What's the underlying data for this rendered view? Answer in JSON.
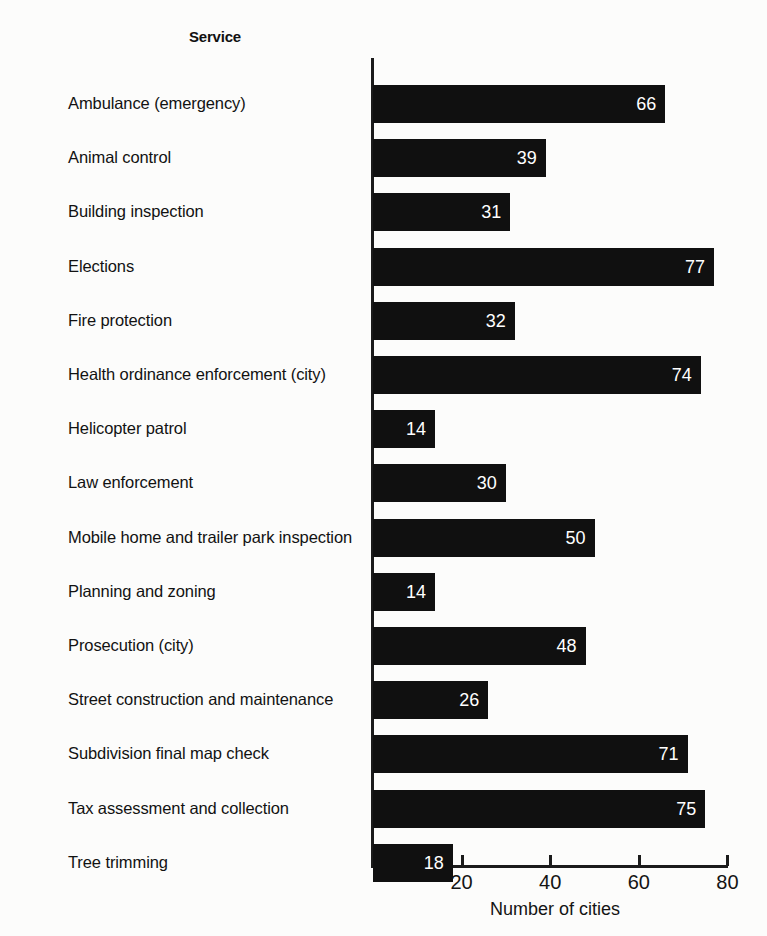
{
  "header": {
    "category_column_title": "Service"
  },
  "chart_data": {
    "type": "bar",
    "orientation": "horizontal",
    "title": "",
    "xlabel": "Number of cities",
    "ylabel": "Service",
    "xlim": [
      0,
      80
    ],
    "xticks": [
      20,
      40,
      60,
      80
    ],
    "grid": false,
    "legend": null,
    "bar_color": "#101010",
    "value_label_color": "#ffffff",
    "background_color": "#fcfcfb",
    "categories": [
      "Ambulance (emergency)",
      "Animal control",
      "Building inspection",
      "Elections",
      "Fire protection",
      "Health ordinance enforcement (city)",
      "Helicopter patrol",
      "Law enforcement",
      "Mobile home and trailer park inspection",
      "Planning and zoning",
      "Prosecution (city)",
      "Street construction and maintenance",
      "Subdivision final map check",
      "Tax assessment and collection",
      "Tree trimming"
    ],
    "values": [
      66,
      39,
      31,
      77,
      32,
      74,
      14,
      30,
      50,
      14,
      48,
      26,
      71,
      75,
      18
    ]
  }
}
